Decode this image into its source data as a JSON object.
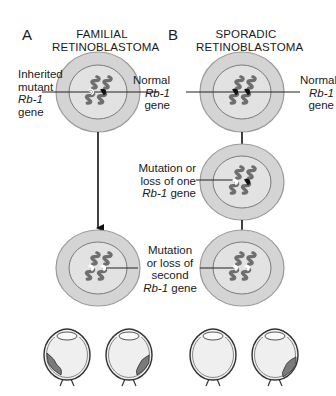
{
  "panels": [
    {
      "letter": "A",
      "title_line1": "FAMILIAL",
      "title_line2": "RETINOBLASTOMA",
      "labels": {
        "inherited": {
          "line1": "Inherited",
          "line2": "mutant",
          "gene": "Rb-1",
          "line4": "gene"
        },
        "normal": {
          "line1": "Normal",
          "gene": "Rb-1",
          "line3": "gene"
        },
        "second_hit": {
          "line1": "Mutation",
          "line2": "or loss of",
          "line3": "second",
          "gene": "Rb-1",
          "gene_suffix": " gene"
        }
      }
    },
    {
      "letter": "B",
      "title_line1": "SPORADIC",
      "title_line2": "RETINOBLASTOMA",
      "labels": {
        "normal_left": {
          "line1": "Normal",
          "gene": "Rb-1",
          "line3": "gene"
        },
        "normal_right": {
          "line1": "Normal",
          "gene": "Rb-1",
          "line3": "gene"
        },
        "first_hit": {
          "line1": "Mutation or",
          "line2": "loss of one",
          "gene": "Rb-1",
          "gene_suffix": " gene"
        }
      }
    }
  ],
  "colors": {
    "cell_outer": "#d4d4d4",
    "cell_inner": "#e2e2e2",
    "chromosome": "#6e6e6e",
    "normal_gene": "#111111",
    "mutant_gene": "#ffffff",
    "tumor": "#7a7a7a",
    "eye_fill": "#efefef"
  }
}
